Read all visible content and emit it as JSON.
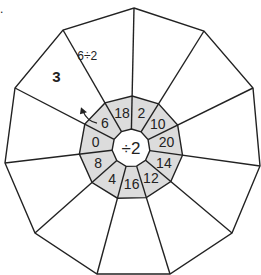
{
  "question_marker": ".",
  "center_operation": "÷2",
  "inner_ring_values": [
    "2",
    "10",
    "20",
    "14",
    "12",
    "16",
    "4",
    "8",
    "0",
    "6",
    "18"
  ],
  "example": {
    "inner_value": "6",
    "working": "6÷2",
    "answer": "3"
  },
  "colors": {
    "shade": "#dcdcdc",
    "line": "#222222"
  }
}
